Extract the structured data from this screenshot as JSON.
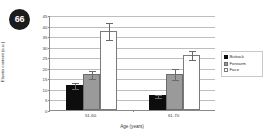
{
  "figure": {
    "number": "66"
  },
  "legend": {
    "position": "right",
    "entries": [
      "Buttock",
      "Forearm",
      "Face"
    ]
  },
  "chart_data": {
    "type": "bar",
    "title": "",
    "xlabel": "Age (years)",
    "ylabel": "Elastin content (a.u.)",
    "categories": [
      "51-60",
      "61-70"
    ],
    "ylim": [
      0,
      45
    ],
    "yticks": [
      0,
      5,
      10,
      15,
      20,
      25,
      30,
      35,
      40,
      45
    ],
    "grid": true,
    "series": [
      {
        "name": "Buttock",
        "color": "#0d0d0d",
        "values": [
          12.0,
          7.0
        ],
        "errors": [
          1.5,
          0.8
        ]
      },
      {
        "name": "Forearm",
        "color": "#9a9a9a",
        "values": [
          17.0,
          17.2
        ],
        "errors": [
          1.8,
          2.5
        ]
      },
      {
        "name": "Face",
        "color": "#ffffff",
        "values": [
          37.5,
          26.2
        ],
        "errors": [
          4.0,
          2.2
        ]
      }
    ]
  }
}
